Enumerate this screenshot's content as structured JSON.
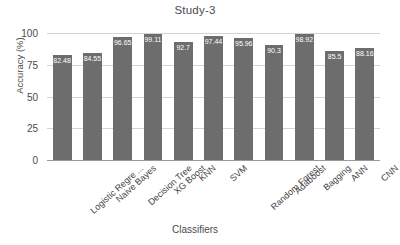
{
  "chart_data": {
    "type": "bar",
    "title": "Study-3",
    "xlabel": "Classifiers",
    "ylabel": "Accuracy (%)",
    "categories": [
      "Logistic Regre ...",
      "Naive Bayes",
      "Decision Tree",
      "XG Boost",
      "KNN",
      "SVM",
      "Random Forest",
      "Adaboost",
      "Bagging",
      "ANN",
      "CNN"
    ],
    "values": [
      82.48,
      84.55,
      96.65,
      99.11,
      92.7,
      97.44,
      95.96,
      90.3,
      98.92,
      85.5,
      88.16
    ],
    "value_labels": [
      "82.48",
      "84.55",
      "96.65",
      "99.11",
      "92.7",
      "97.44",
      "95.96",
      "90.3",
      "98.92",
      "85.5",
      "88.16"
    ],
    "ylim": [
      0,
      100
    ],
    "yticks": [
      0,
      25,
      50,
      75,
      100
    ],
    "ytick_labels": [
      "0",
      "25",
      "50",
      "75",
      "100"
    ],
    "grid": true,
    "legend": false,
    "bar_color": "#6d6d6d",
    "grid_color": "#d4d4d4",
    "text_color": "#4a4a4a",
    "value_label_color": "#ffffff"
  }
}
